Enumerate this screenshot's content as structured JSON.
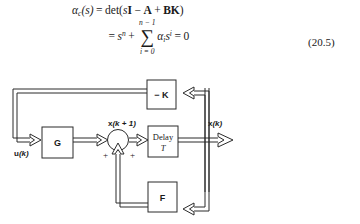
{
  "equation": {
    "line1": {
      "lhs_alpha": "α",
      "lhs_sub": "c",
      "lhs_arg": "(s)",
      "equals": "=",
      "det": "det(",
      "s": "s",
      "I": "I",
      "minus": "−",
      "A": "A",
      "plus": "+",
      "BK": "BK",
      "close": ")"
    },
    "line2": {
      "equals": "=",
      "s": "s",
      "exp_n": "n",
      "plus": "+",
      "sum_sign": "∑",
      "sum_upper": "n − 1",
      "sum_lower": "i = 0",
      "alpha": "α",
      "alpha_sub": "i",
      "s2": "s",
      "exp_i": "i",
      "equals2": "=",
      "zero": "0"
    },
    "number": "(20.5)"
  },
  "diagram": {
    "blocks": [
      {
        "id": "gain-k",
        "label": "− K"
      },
      {
        "id": "plant-g",
        "label": "G"
      },
      {
        "id": "delay",
        "label": "Delay",
        "sublabel": "T"
      },
      {
        "id": "feedback-f",
        "label": "F"
      }
    ],
    "signals": {
      "input": "u(k)",
      "input_main": "u",
      "input_arg": "(k)",
      "state_next_main": "x",
      "state_next_arg": "(k + 1)",
      "state_main": "x",
      "state_arg": "(k)"
    },
    "sum_signs": {
      "left": "+",
      "right": "+"
    },
    "colors": {
      "line": "#2b2b2b",
      "fill": "#ffffff",
      "text": "#1a1a1a"
    }
  }
}
